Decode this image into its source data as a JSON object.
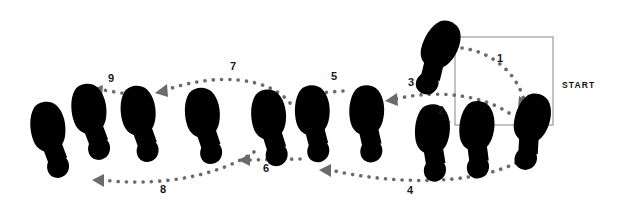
{
  "diagram": {
    "start_label": "START",
    "colors": {
      "dark_sole": "#565656",
      "dark_heel": "#4a4a4a",
      "mid_sole": "#cfcfcf",
      "light_sole": "#e9e9e9",
      "light_heel": "#dcdcdc",
      "white_arch": "#ffffff",
      "outline": "#6f6f6f",
      "dot": "#6b6b6b",
      "text": "#1a1a1a",
      "box_border": "#9a9a9a",
      "background": "#ffffff"
    },
    "step_numbers": [
      "1",
      "2",
      "3",
      "4",
      "5",
      "6",
      "7",
      "8",
      "9"
    ],
    "steps": [
      {
        "id": "1",
        "label": "1",
        "label_x": 500,
        "label_y": 62,
        "shade": "dark"
      },
      {
        "id": "2",
        "label": "2",
        "label_x": 438,
        "label_y": 110,
        "shade": "light"
      },
      {
        "id": "3",
        "label": "3",
        "label_x": 406,
        "label_y": 85,
        "shade": "dark"
      },
      {
        "id": "4",
        "label": "4",
        "label_x": 404,
        "label_y": 191,
        "shade": "light"
      },
      {
        "id": "5",
        "label": "5",
        "label_x": 331,
        "label_y": 76,
        "shade": "dark"
      },
      {
        "id": "6",
        "label": "6",
        "label_x": 265,
        "label_y": 168,
        "shade": "light"
      },
      {
        "id": "7",
        "label": "7",
        "label_x": 231,
        "label_y": 67,
        "shade": "dark"
      },
      {
        "id": "8",
        "label": "8",
        "label_x": 161,
        "label_y": 190,
        "shade": "light"
      },
      {
        "id": "9",
        "label": "9",
        "label_x": 110,
        "label_y": 79,
        "shade": "dark"
      }
    ],
    "footprints": [
      {
        "name": "footprint-start-right-dark",
        "shade": "dark",
        "x": 437,
        "y": 58,
        "rot": 28,
        "scale": 1.0
      },
      {
        "name": "footprint-start-left-dark",
        "shade": "dark",
        "x": 531,
        "y": 132,
        "rot": 18,
        "scale": 1.0
      },
      {
        "name": "footprint-step2-right-light",
        "shade": "light",
        "x": 478,
        "y": 140,
        "rot": 7,
        "scale": 1.0
      },
      {
        "name": "footprint-step2-left-light",
        "shade": "light",
        "x": 434,
        "y": 143,
        "rot": 5,
        "scale": 1.0
      },
      {
        "name": "footprint-step3-dark-a",
        "shade": "dark",
        "x": 369,
        "y": 124,
        "rot": 3,
        "scale": 1.0
      },
      {
        "name": "footprint-step5-dark-b",
        "shade": "dark",
        "x": 315,
        "y": 124,
        "rot": 0,
        "scale": 1.0
      },
      {
        "name": "footprint-step6-light-a",
        "shade": "light",
        "x": 272,
        "y": 128,
        "rot": -3,
        "scale": 1.0
      },
      {
        "name": "footprint-step6-light-b",
        "shade": "light",
        "x": 206,
        "y": 126,
        "rot": -3,
        "scale": 1.0
      },
      {
        "name": "footprint-step7-dark-a",
        "shade": "dark",
        "x": 142,
        "y": 124,
        "rot": -5,
        "scale": 1.0
      },
      {
        "name": "footprint-step9-dark-b",
        "shade": "dark",
        "x": 93,
        "y": 122,
        "rot": -5,
        "scale": 1.0
      },
      {
        "name": "footprint-step8-light-end",
        "shade": "light",
        "x": 52,
        "y": 140,
        "rot": -5,
        "scale": 1.0
      }
    ],
    "start_box": {
      "x": 455,
      "y": 37,
      "width": 98,
      "height": 88
    },
    "start_text_x": 583,
    "start_text_y": 85
  }
}
